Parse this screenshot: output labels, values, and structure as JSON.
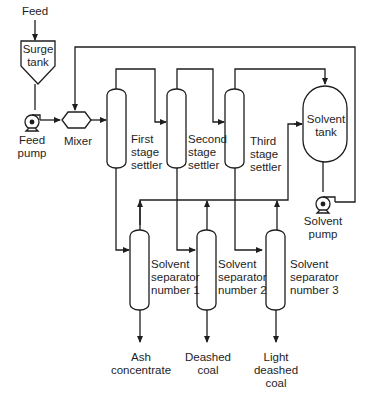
{
  "diagram": {
    "type": "process-flow",
    "line_color": "#1e1e1e",
    "background": "#ffffff",
    "labels": {
      "feed": "Feed",
      "surge_tank": "Surge\ntank",
      "feed_pump": "Feed\npump",
      "mixer": "Mixer",
      "first_stage_settler": "First\nstage\nsettler",
      "second_stage_settler": "Second\nstage\nsettler",
      "third_stage_settler": "Third\nstage\nsettler",
      "solvent_tank": "Solvent\ntank",
      "solvent_pump": "Solvent\npump",
      "solvent_separator_1": "Solvent\nseparator\nnumber 1",
      "solvent_separator_2": "Solvent\nseparator\nnumber 2",
      "solvent_separator_3": "Solvent\nseparator\nnumber 3",
      "ash_concentrate": "Ash\nconcentrate",
      "deashed_coal": "Deashed\ncoal",
      "light_deashed_coal": "Light\ndeashed\ncoal"
    },
    "nodes": [
      {
        "id": "surge_tank",
        "kind": "hopper"
      },
      {
        "id": "feed_pump",
        "kind": "pump"
      },
      {
        "id": "mixer",
        "kind": "mixer"
      },
      {
        "id": "first_stage_settler",
        "kind": "column"
      },
      {
        "id": "second_stage_settler",
        "kind": "column"
      },
      {
        "id": "third_stage_settler",
        "kind": "column"
      },
      {
        "id": "solvent_tank",
        "kind": "vessel"
      },
      {
        "id": "solvent_pump",
        "kind": "pump"
      },
      {
        "id": "solvent_separator_1",
        "kind": "column"
      },
      {
        "id": "solvent_separator_2",
        "kind": "column"
      },
      {
        "id": "solvent_separator_3",
        "kind": "column"
      }
    ],
    "edges": [
      {
        "from": "feed",
        "to": "surge_tank"
      },
      {
        "from": "surge_tank",
        "to": "feed_pump"
      },
      {
        "from": "feed_pump",
        "to": "mixer"
      },
      {
        "from": "solvent_pump",
        "to": "mixer"
      },
      {
        "from": "mixer",
        "to": "first_stage_settler"
      },
      {
        "from": "first_stage_settler",
        "to": "second_stage_settler"
      },
      {
        "from": "second_stage_settler",
        "to": "third_stage_settler"
      },
      {
        "from": "third_stage_settler",
        "to": "solvent_tank"
      },
      {
        "from": "first_stage_settler",
        "to": "solvent_separator_1"
      },
      {
        "from": "second_stage_settler",
        "to": "solvent_separator_2"
      },
      {
        "from": "third_stage_settler",
        "to": "solvent_separator_3"
      },
      {
        "from": "solvent_separator_1",
        "to": "solvent_tank"
      },
      {
        "from": "solvent_separator_2",
        "to": "solvent_tank"
      },
      {
        "from": "solvent_separator_3",
        "to": "solvent_tank"
      },
      {
        "from": "solvent_tank",
        "to": "solvent_pump"
      },
      {
        "from": "solvent_separator_1",
        "to": "ash_concentrate"
      },
      {
        "from": "solvent_separator_2",
        "to": "deashed_coal"
      },
      {
        "from": "solvent_separator_3",
        "to": "light_deashed_coal"
      }
    ]
  }
}
